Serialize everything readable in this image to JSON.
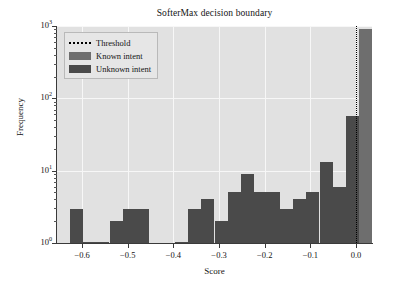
{
  "chart_data": {
    "type": "bar",
    "title": "SofterMax decision boundary",
    "xlabel": "Score",
    "ylabel": "Frequency",
    "yscale": "log",
    "ylim": [
      1,
      1000
    ],
    "xlim": [
      -0.655,
      0.035
    ],
    "grid": true,
    "legend_position": "upper left",
    "ytick_labels": [
      "10^0",
      "10^1",
      "10^2",
      "10^3"
    ],
    "ytick_values": [
      1,
      10,
      100,
      1000
    ],
    "xtick_labels": [
      "−0.6",
      "−0.5",
      "−0.4",
      "−0.3",
      "−0.2",
      "−0.1",
      "0.0"
    ],
    "xtick_values": [
      -0.6,
      -0.5,
      -0.4,
      -0.3,
      -0.2,
      -0.1,
      0.0
    ],
    "bin_width": 0.0287,
    "annotations": [
      {
        "name": "threshold",
        "x": 0.0,
        "label": "Threshold",
        "style": "dotted-vertical-black"
      }
    ],
    "series": [
      {
        "name": "Unknown intent",
        "color": "#4a4a4a",
        "bins": [
          {
            "x0": -0.655,
            "x1": -0.626,
            "value": 0
          },
          {
            "x0": -0.626,
            "x1": -0.598,
            "value": 3
          },
          {
            "x0": -0.598,
            "x1": -0.569,
            "value": 1
          },
          {
            "x0": -0.569,
            "x1": -0.54,
            "value": 1
          },
          {
            "x0": -0.54,
            "x1": -0.511,
            "value": 2
          },
          {
            "x0": -0.511,
            "x1": -0.483,
            "value": 3
          },
          {
            "x0": -0.483,
            "x1": -0.454,
            "value": 3
          },
          {
            "x0": -0.454,
            "x1": -0.425,
            "value": 0
          },
          {
            "x0": -0.425,
            "x1": -0.396,
            "value": 0
          },
          {
            "x0": -0.396,
            "x1": -0.368,
            "value": 1
          },
          {
            "x0": -0.368,
            "x1": -0.339,
            "value": 3
          },
          {
            "x0": -0.339,
            "x1": -0.31,
            "value": 4
          },
          {
            "x0": -0.31,
            "x1": -0.281,
            "value": 2
          },
          {
            "x0": -0.281,
            "x1": -0.253,
            "value": 5
          },
          {
            "x0": -0.253,
            "x1": -0.224,
            "value": 9
          },
          {
            "x0": -0.224,
            "x1": -0.195,
            "value": 5
          },
          {
            "x0": -0.195,
            "x1": -0.166,
            "value": 5
          },
          {
            "x0": -0.166,
            "x1": -0.138,
            "value": 3
          },
          {
            "x0": -0.138,
            "x1": -0.109,
            "value": 4
          },
          {
            "x0": -0.109,
            "x1": -0.08,
            "value": 5
          },
          {
            "x0": -0.08,
            "x1": -0.051,
            "value": 13
          },
          {
            "x0": -0.051,
            "x1": -0.023,
            "value": 6
          },
          {
            "x0": -0.023,
            "x1": 0.006,
            "value": 57
          },
          {
            "x0": 0.006,
            "x1": 0.035,
            "value": 0
          }
        ]
      },
      {
        "name": "Known intent",
        "color": "#6e6e6e",
        "bins": [
          {
            "x0": -0.655,
            "x1": -0.626,
            "value": 0
          },
          {
            "x0": -0.626,
            "x1": -0.598,
            "value": 0
          },
          {
            "x0": -0.598,
            "x1": -0.569,
            "value": 0
          },
          {
            "x0": -0.569,
            "x1": -0.54,
            "value": 0
          },
          {
            "x0": -0.54,
            "x1": -0.511,
            "value": 0
          },
          {
            "x0": -0.511,
            "x1": -0.483,
            "value": 0
          },
          {
            "x0": -0.483,
            "x1": -0.454,
            "value": 0
          },
          {
            "x0": -0.454,
            "x1": -0.425,
            "value": 0
          },
          {
            "x0": -0.425,
            "x1": -0.396,
            "value": 0
          },
          {
            "x0": -0.396,
            "x1": -0.368,
            "value": 1
          },
          {
            "x0": -0.368,
            "x1": -0.339,
            "value": 0
          },
          {
            "x0": -0.339,
            "x1": -0.31,
            "value": 0
          },
          {
            "x0": -0.31,
            "x1": -0.281,
            "value": 0
          },
          {
            "x0": -0.281,
            "x1": -0.253,
            "value": 0
          },
          {
            "x0": -0.253,
            "x1": -0.224,
            "value": 0
          },
          {
            "x0": -0.224,
            "x1": -0.195,
            "value": 0
          },
          {
            "x0": -0.195,
            "x1": -0.166,
            "value": 0
          },
          {
            "x0": -0.166,
            "x1": -0.138,
            "value": 1
          },
          {
            "x0": -0.138,
            "x1": -0.109,
            "value": 0
          },
          {
            "x0": -0.109,
            "x1": -0.08,
            "value": 0
          },
          {
            "x0": -0.08,
            "x1": -0.051,
            "value": 1
          },
          {
            "x0": -0.051,
            "x1": -0.023,
            "value": 3
          },
          {
            "x0": -0.023,
            "x1": 0.006,
            "value": 16
          },
          {
            "x0": 0.006,
            "x1": 0.035,
            "value": 900
          }
        ]
      }
    ]
  },
  "legend": {
    "items": [
      {
        "label": "Threshold",
        "kind": "threshold"
      },
      {
        "label": "Known intent",
        "kind": "known"
      },
      {
        "label": "Unknown intent",
        "kind": "unknown"
      }
    ]
  }
}
